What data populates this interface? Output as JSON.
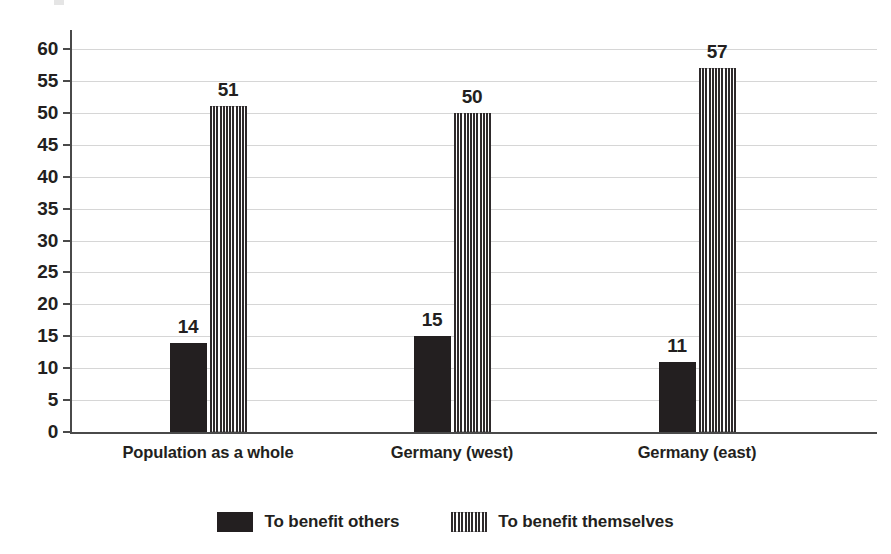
{
  "chart_data": {
    "type": "bar",
    "title": "",
    "subtitle": "",
    "xlabel": "",
    "ylabel": "",
    "ylim": [
      0,
      60
    ],
    "ytick_step": 5,
    "yticks": [
      60,
      55,
      50,
      45,
      40,
      35,
      30,
      25,
      20,
      15,
      10,
      5,
      0
    ],
    "grid": true,
    "grid_axis": "y",
    "legend_position": "bottom-center",
    "categories": [
      "Population as a whole",
      "Germany (west)",
      "Germany (east)"
    ],
    "series": [
      {
        "name": "To benefit others",
        "fill": "solid",
        "color": "#231f20",
        "values": [
          14,
          15,
          11
        ]
      },
      {
        "name": "To benefit themselves",
        "fill": "vertical-stripes",
        "color": "#2e2a2b",
        "values": [
          51,
          50,
          57
        ]
      }
    ]
  },
  "legend": {
    "items": [
      {
        "label": "To benefit others",
        "swatch": "solid-swatch"
      },
      {
        "label": "To benefit themselves",
        "swatch": "striped-swatch"
      }
    ]
  },
  "axis": {
    "y_tick_labels": [
      "60",
      "55",
      "50",
      "45",
      "40",
      "35",
      "30",
      "25",
      "20",
      "15",
      "10",
      "5",
      "0"
    ]
  },
  "bar_labels": {
    "group0": [
      "14",
      "51"
    ],
    "group1": [
      "15",
      "50"
    ],
    "group2": [
      "11",
      "57"
    ]
  },
  "colors": {
    "bar_solid": "#231f20",
    "bar_stripe": "#2e2a2b",
    "gridline": "#d6d6d6",
    "axis": "#4a4a4a",
    "text": "#231f20",
    "background": "#ffffff"
  }
}
